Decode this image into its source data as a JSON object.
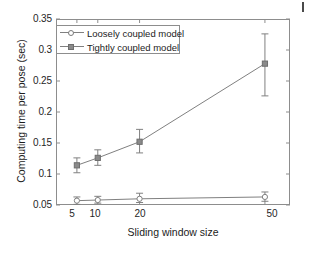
{
  "figure": {
    "background_color": "#ffffff",
    "axis_color": "#8d8d8d",
    "series_color": "#808080",
    "text_color": "#1c1c1c",
    "corner_mark": ""
  },
  "chart_data": {
    "type": "line",
    "title": "",
    "xlabel": "Sliding window size",
    "ylabel": "Computing time per pose (sec)",
    "x": [
      5,
      10,
      20,
      50
    ],
    "xtick_labels": [
      "5",
      "10",
      "20",
      "50"
    ],
    "xlim": [
      0,
      56
    ],
    "ylim": [
      0.05,
      0.35
    ],
    "ytick_labels": [
      "0.05",
      "0.1",
      "0.15",
      "0.2",
      "0.25",
      "0.3",
      "0.35"
    ],
    "yticks": [
      0.05,
      0.1,
      0.15,
      0.2,
      0.25,
      0.3,
      0.35
    ],
    "grid": false,
    "legend_position": "upper left",
    "errorbars": true,
    "series": [
      {
        "name": "Loosely coupled model",
        "marker": "open-circle",
        "color": "#808080",
        "values": [
          0.057,
          0.058,
          0.06,
          0.063
        ],
        "err_low": [
          0.006,
          0.005,
          0.006,
          0.007
        ],
        "err_high": [
          0.006,
          0.006,
          0.009,
          0.008
        ]
      },
      {
        "name": "Tightly coupled model",
        "marker": "filled-square",
        "color": "#808080",
        "values": [
          0.114,
          0.126,
          0.152,
          0.278
        ],
        "err_low": [
          0.012,
          0.012,
          0.018,
          0.052
        ],
        "err_high": [
          0.012,
          0.013,
          0.02,
          0.048
        ]
      }
    ]
  },
  "legend": {
    "items": [
      {
        "label": "Loosely coupled model"
      },
      {
        "label": "Tightly coupled model"
      }
    ]
  }
}
